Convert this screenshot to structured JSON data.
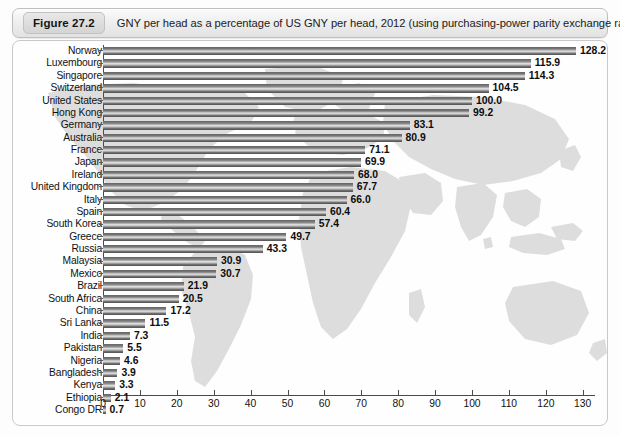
{
  "figure": {
    "badge": "Figure 27.2",
    "caption": "GNY per head as a percentage of US GNY per head, 2012 (using purchasing-power parity exchange rates)"
  },
  "chart_data": {
    "type": "bar",
    "orientation": "horizontal",
    "title": "GNY per head as a percentage of US GNY per head, 2012 (using purchasing-power parity exchange rates)",
    "xlabel": "",
    "ylabel": "",
    "xlim": [
      0,
      135
    ],
    "xticks": [
      0,
      10,
      20,
      30,
      40,
      50,
      60,
      70,
      80,
      90,
      100,
      110,
      120,
      130
    ],
    "grid": false,
    "legend": "none",
    "background_watermark": "world-map",
    "categories": [
      "Norway",
      "Luxembourg",
      "Singapore",
      "Switzerland",
      "United States",
      "Hong Kong",
      "Germany",
      "Australia",
      "France",
      "Japan",
      "Ireland",
      "United Kingdom",
      "Italy",
      "Spain",
      "South Korea",
      "Greece",
      "Russia",
      "Malaysia",
      "Mexico",
      "Brazil",
      "South Africa",
      "China",
      "Sri Lanka",
      "India",
      "Pakistan",
      "Nigeria",
      "Bangladesh",
      "Kenya",
      "Ethiopia",
      "Congo DR"
    ],
    "values": [
      128.2,
      115.9,
      114.3,
      104.5,
      100.0,
      99.2,
      83.1,
      80.9,
      71.1,
      69.9,
      68.0,
      67.7,
      66.0,
      60.4,
      57.4,
      49.7,
      43.3,
      30.9,
      30.7,
      21.9,
      20.5,
      17.2,
      11.5,
      7.3,
      5.5,
      4.6,
      3.9,
      3.3,
      2.1,
      0.7
    ],
    "value_labels": [
      "128.2",
      "115.9",
      "114.3",
      "104.5",
      "100.0",
      "99.2",
      "83.1",
      "80.9",
      "71.1",
      "69.9",
      "68.0",
      "67.7",
      "66.0",
      "60.4",
      "57.4",
      "49.7",
      "43.3",
      "30.9",
      "30.7",
      "21.9",
      "20.5",
      "17.2",
      "11.5",
      "7.3",
      "5.5",
      "4.6",
      "3.9",
      "3.3",
      "2.1",
      "0.7"
    ],
    "tick_labels": [
      "0",
      "10",
      "20",
      "30",
      "40",
      "50",
      "60",
      "70",
      "80",
      "90",
      "100",
      "110",
      "120",
      "130"
    ]
  },
  "colors": {
    "bar_dark": "#5e5e5e",
    "bar_light": "#e3e3e3",
    "axis": "#4a4a4a",
    "text": "#111111",
    "frame_border": "#c9c9c9",
    "map_watermark": "#dcdcdc",
    "title_bar_bg": "#efefef"
  }
}
